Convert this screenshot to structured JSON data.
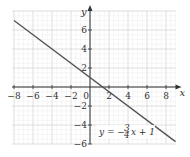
{
  "chart_data": {
    "type": "line",
    "title": "",
    "xlabel": "x",
    "ylabel": "y",
    "xlim": [
      -8.2,
      9
    ],
    "ylim": [
      -6,
      8
    ],
    "grid": true,
    "x_ticks": [
      -8,
      -6,
      -4,
      -2,
      2,
      4,
      6,
      8
    ],
    "y_ticks": [
      6,
      4,
      2,
      -2,
      -4,
      -6
    ],
    "x_tick_labels": [
      "−8",
      "−6",
      "−4",
      "−2",
      "2",
      "4",
      "6",
      "8"
    ],
    "y_tick_labels": [
      "6",
      "4",
      "2",
      "−2",
      "−4",
      "−6"
    ],
    "origin_label": "0",
    "series": [
      {
        "name": "y = -3/4 x + 1",
        "slope": -0.75,
        "intercept": 1,
        "x": [
          -8,
          9
        ],
        "y": [
          7,
          -5.75
        ],
        "color": "#555555"
      }
    ],
    "annotations": [
      {
        "text_prefix": "y = −",
        "fraction_num": "3",
        "fraction_den": "4",
        "text_suffix": "x + 1",
        "x": 1.5,
        "y": -5
      }
    ]
  }
}
